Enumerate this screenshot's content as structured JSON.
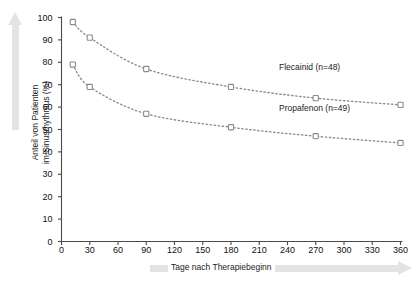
{
  "chart_data": {
    "type": "line",
    "title": "",
    "xlabel": "Tage nach Therapiebeginn",
    "ylabel": "Anteil von Patienten\nim Sinusrhythmus (%)",
    "xlim": [
      0,
      360
    ],
    "ylim": [
      0,
      100
    ],
    "xticks": [
      0,
      30,
      60,
      90,
      120,
      150,
      180,
      210,
      240,
      270,
      300,
      330,
      360
    ],
    "yticks": [
      0,
      10,
      20,
      30,
      40,
      50,
      60,
      70,
      80,
      90,
      100
    ],
    "grid": false,
    "legend_position": "inline-right",
    "linestyle": "dotted",
    "marker": "open-square",
    "series": [
      {
        "name": "Flecainid (n=48)",
        "label": "Flecainid (n=48)",
        "color": "#8a8a8a",
        "label_x": 278,
        "label_y": 62,
        "points": [
          {
            "x": 12,
            "y": 98
          },
          {
            "x": 30,
            "y": 91
          },
          {
            "x": 90,
            "y": 77
          },
          {
            "x": 180,
            "y": 69
          },
          {
            "x": 270,
            "y": 64
          },
          {
            "x": 360,
            "y": 61
          }
        ]
      },
      {
        "name": "Propafenon (n=49)",
        "label": "Propafenon (n=49)",
        "color": "#8a8a8a",
        "label_x": 278,
        "label_y": 103,
        "points": [
          {
            "x": 12,
            "y": 79
          },
          {
            "x": 30,
            "y": 69
          },
          {
            "x": 90,
            "y": 57
          },
          {
            "x": 180,
            "y": 51
          },
          {
            "x": 270,
            "y": 47
          },
          {
            "x": 360,
            "y": 44
          }
        ]
      }
    ]
  },
  "colors": {
    "axis": "#4a4a4a",
    "series": "#8a8a8a",
    "decor_arrow": "#e3e3e3",
    "text": "#1b1b1b"
  }
}
